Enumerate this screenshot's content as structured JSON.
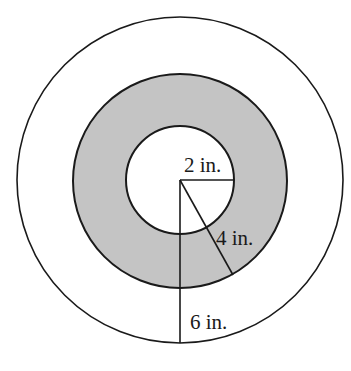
{
  "diagram": {
    "type": "concentric-circles",
    "center": [
      180,
      180
    ],
    "colors": {
      "stroke": "#1a1a1a",
      "background": "#ffffff",
      "ring_fill": "#c4c4c4",
      "inner_fill": "#ffffff"
    },
    "circles": [
      {
        "name": "outer",
        "radius_px": 163,
        "fill": "#ffffff"
      },
      {
        "name": "middle",
        "radius_px": 107,
        "fill": "#c4c4c4"
      },
      {
        "name": "inner",
        "radius_px": 54,
        "fill": "#ffffff"
      }
    ],
    "radii": [
      {
        "name": "inner-radius",
        "from": [
          180,
          180
        ],
        "to": [
          234,
          180
        ],
        "label": "2 in.",
        "label_pos": [
          184,
          172
        ]
      },
      {
        "name": "middle-radius",
        "from": [
          180,
          180
        ],
        "to": [
          233,
          275
        ],
        "label": "4 in.",
        "label_pos": [
          216,
          245
        ]
      },
      {
        "name": "outer-radius",
        "from": [
          180,
          180
        ],
        "to": [
          180,
          343
        ],
        "label": "6 in.",
        "label_pos": [
          190,
          329
        ]
      }
    ]
  }
}
